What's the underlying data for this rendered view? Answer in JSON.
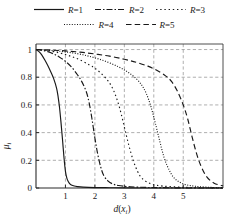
{
  "legend": {
    "rows": [
      [
        {
          "label": "R=1",
          "var": "R",
          "eq": "=1",
          "style": "solid",
          "dash": "none"
        },
        {
          "label": "R=2",
          "var": "R",
          "eq": "=2",
          "style": "dash-dot",
          "dash": "6 2 1.5 2"
        },
        {
          "label": "R=3",
          "var": "R",
          "eq": "=3",
          "style": "dotted",
          "dash": "1.4 2.8"
        }
      ],
      [
        {
          "label": "R=4",
          "var": "R",
          "eq": "=4",
          "style": "fine-dotted",
          "dash": "1 1.6"
        },
        {
          "label": "R=5",
          "var": "R",
          "eq": "=5",
          "style": "dashed",
          "dash": "5.5 3.2"
        }
      ]
    ]
  },
  "chart_data": {
    "type": "line",
    "title": "",
    "xlabel": "d(x_i)",
    "xlabel_main": "d",
    "xlabel_paren_open": "(",
    "xlabel_var": "x",
    "xlabel_sub": "i",
    "xlabel_paren_close": ")",
    "ylabel": "μ_i",
    "ylabel_main": "μ",
    "ylabel_sub": "i",
    "xlim": [
      0,
      6.35
    ],
    "ylim": [
      0,
      1.04
    ],
    "xticks": [
      1,
      2,
      3,
      4,
      5
    ],
    "xticklabels": [
      "1",
      "2",
      "3",
      "4",
      "5"
    ],
    "yticks": [
      0,
      0.2,
      0.4,
      0.6,
      0.8,
      1
    ],
    "yticklabels": [
      "0",
      "0.2",
      "0.4",
      "0.6",
      "0.8",
      "1"
    ],
    "grid": true,
    "grid_style": "dashed",
    "legend_position": "above-plot",
    "series": [
      {
        "name": "R=1",
        "R": 1,
        "style": "solid",
        "dash": "none",
        "x": [
          0,
          0.1,
          0.2,
          0.3,
          0.4,
          0.5,
          0.6,
          0.7,
          0.75,
          0.8,
          0.85,
          0.9,
          0.95,
          1.0,
          1.05,
          1.1,
          1.15,
          1.2,
          1.3,
          1.4,
          1.6,
          2.0,
          2.5,
          3.0,
          4.0,
          5.0,
          6.35
        ],
        "y": [
          1.0,
          0.985,
          0.96,
          0.925,
          0.885,
          0.84,
          0.79,
          0.72,
          0.66,
          0.58,
          0.47,
          0.35,
          0.22,
          0.12,
          0.07,
          0.045,
          0.03,
          0.022,
          0.014,
          0.01,
          0.006,
          0.003,
          0.002,
          0.001,
          0.0,
          0.0,
          0.0
        ]
      },
      {
        "name": "R=2",
        "R": 2,
        "style": "dash-dot",
        "dash": "6 2 1.5 2",
        "x": [
          0,
          0.2,
          0.4,
          0.6,
          0.8,
          1.0,
          1.2,
          1.4,
          1.55,
          1.7,
          1.8,
          1.9,
          2.0,
          2.1,
          2.2,
          2.3,
          2.45,
          2.6,
          2.8,
          3.2,
          3.8,
          4.5,
          5.3,
          6.35
        ],
        "y": [
          1.0,
          0.995,
          0.985,
          0.968,
          0.945,
          0.915,
          0.875,
          0.82,
          0.77,
          0.7,
          0.62,
          0.5,
          0.36,
          0.24,
          0.15,
          0.09,
          0.05,
          0.03,
          0.018,
          0.009,
          0.004,
          0.002,
          0.0,
          0.0
        ]
      },
      {
        "name": "R=3",
        "R": 3,
        "style": "dotted",
        "dash": "1.4 2.8",
        "x": [
          0,
          0.3,
          0.6,
          0.9,
          1.2,
          1.5,
          1.8,
          2.0,
          2.2,
          2.4,
          2.55,
          2.7,
          2.85,
          3.0,
          3.15,
          3.3,
          3.45,
          3.6,
          3.9,
          4.3,
          4.9,
          5.6,
          6.35
        ],
        "y": [
          1.0,
          0.995,
          0.985,
          0.97,
          0.95,
          0.925,
          0.89,
          0.865,
          0.83,
          0.785,
          0.74,
          0.67,
          0.57,
          0.44,
          0.31,
          0.2,
          0.12,
          0.07,
          0.03,
          0.014,
          0.006,
          0.002,
          0.0
        ]
      },
      {
        "name": "R=4",
        "R": 4,
        "style": "fine-dotted",
        "dash": "1 1.6",
        "x": [
          0,
          0.4,
          0.8,
          1.2,
          1.6,
          2.0,
          2.4,
          2.8,
          3.1,
          3.4,
          3.6,
          3.75,
          3.9,
          4.05,
          4.2,
          4.35,
          4.5,
          4.7,
          5.0,
          5.4,
          5.9,
          6.35
        ],
        "y": [
          1.0,
          0.995,
          0.988,
          0.977,
          0.962,
          0.94,
          0.912,
          0.875,
          0.84,
          0.79,
          0.74,
          0.68,
          0.59,
          0.47,
          0.34,
          0.22,
          0.14,
          0.07,
          0.03,
          0.013,
          0.005,
          0.002
        ]
      },
      {
        "name": "R=5",
        "R": 5,
        "style": "dashed",
        "dash": "5.5 3.2",
        "x": [
          0,
          0.5,
          1.0,
          1.5,
          2.0,
          2.5,
          3.0,
          3.4,
          3.8,
          4.1,
          4.4,
          4.6,
          4.8,
          5.0,
          5.15,
          5.3,
          5.45,
          5.6,
          5.8,
          6.05,
          6.35
        ],
        "y": [
          1.0,
          0.996,
          0.99,
          0.981,
          0.968,
          0.952,
          0.93,
          0.908,
          0.88,
          0.85,
          0.81,
          0.77,
          0.7,
          0.6,
          0.5,
          0.37,
          0.25,
          0.16,
          0.08,
          0.035,
          0.015
        ]
      }
    ]
  }
}
